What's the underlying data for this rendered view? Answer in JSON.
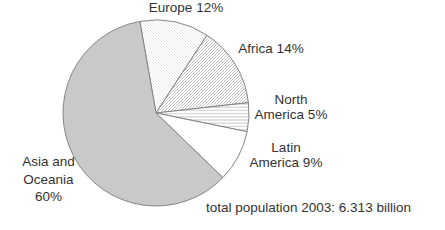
{
  "labels": {
    "europe": "Europe 12%",
    "africa": "Africa 14%",
    "north_america": [
      "North",
      "America 5%"
    ],
    "latin_america": [
      "Latin",
      "America 9%"
    ],
    "asia_oceania": [
      "Asia and",
      "Oceania",
      "60%"
    ],
    "footnote": "total population 2003: 6.313 billion"
  },
  "colors": {
    "background": "#ffffff",
    "asia_slice_gray": "#c9c9c9",
    "slice_outline": "#858585",
    "hatch_line": "#8f8f8f",
    "light_hatch_line": "#e0e0e0",
    "text": "#333333"
  },
  "chart_data": {
    "type": "pie",
    "title": "",
    "annotation": "total population 2003: 6.313 billion",
    "categories": [
      "Europe",
      "Africa",
      "North America",
      "Latin America",
      "Asia and Oceania"
    ],
    "values": [
      12,
      14,
      5,
      9,
      60
    ],
    "unit": "percent",
    "legend_position": "labels-around-pie",
    "start_angle_deg": -10,
    "direction": "clockwise",
    "center": [
      156,
      113
    ],
    "radius": 93,
    "slices": [
      {
        "id": "europe",
        "label": "Europe",
        "value": 12,
        "fill": "pattern-light-diagonal",
        "style": "faint diagonal hatch"
      },
      {
        "id": "africa",
        "label": "Africa",
        "value": 14,
        "fill": "pattern-diagonal",
        "style": "diagonal hatch"
      },
      {
        "id": "north-america",
        "label": "North America",
        "value": 5,
        "fill": "pattern-horizontal",
        "style": "horizontal line hatch"
      },
      {
        "id": "latin-america",
        "label": "Latin America",
        "value": 9,
        "fill": "#ffffff",
        "style": "plain white"
      },
      {
        "id": "asia-oceania",
        "label": "Asia and Oceania",
        "value": 60,
        "fill": "#c9c9c9",
        "style": "solid gray"
      }
    ]
  }
}
